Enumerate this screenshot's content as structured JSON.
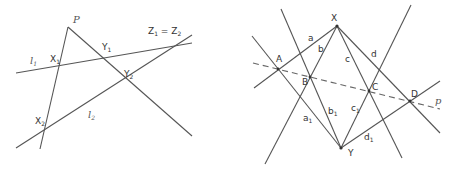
{
  "left_figure": {
    "labels": {
      "P": "P",
      "l1": "l",
      "l1_sub": "1",
      "l2": "l",
      "l2_sub": "2",
      "X1": "X",
      "X1_sub": "1",
      "X2": "X",
      "X2_sub": "2",
      "Y1": "Y",
      "Y1_sub": "1",
      "Y2": "Y",
      "Y2_sub": "2",
      "Z": "Z",
      "Z1_sub": "1",
      "eq": " = ",
      "Z2": "Z",
      "Z2_sub": "2"
    }
  },
  "right_figure": {
    "labels": {
      "X": "X",
      "Y": "Y",
      "A": "A",
      "B": "B",
      "C": "C",
      "D": "D",
      "p": "p",
      "a": "a",
      "b": "b",
      "c": "c",
      "d": "d",
      "a1": "a",
      "a1_sub": "1",
      "b1": "b",
      "b1_sub": "1",
      "c1": "c",
      "c1_sub": "1",
      "d1": "d",
      "d1_sub": "1"
    }
  },
  "colors": {
    "line": "#555555",
    "text": "#333333",
    "background": "#ffffff"
  }
}
